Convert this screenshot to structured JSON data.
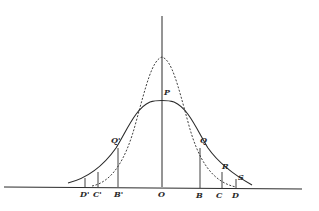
{
  "figure": {
    "curves": [
      {
        "name": "solid-curve",
        "style": "solid",
        "peak_label": "P"
      },
      {
        "name": "dashed-curve",
        "style": "dashed"
      }
    ],
    "labels": {
      "P": "P",
      "Q_left": "Q'",
      "Q_right": "Q",
      "R": "R",
      "S": "S",
      "D_left": "D'",
      "C_left": "C'",
      "B_left": "B'",
      "O": "O",
      "B_right": "B",
      "C_right": "C",
      "D_right": "D"
    },
    "colors": {
      "ink": "#2a2a2a",
      "background": "#ffffff"
    }
  }
}
